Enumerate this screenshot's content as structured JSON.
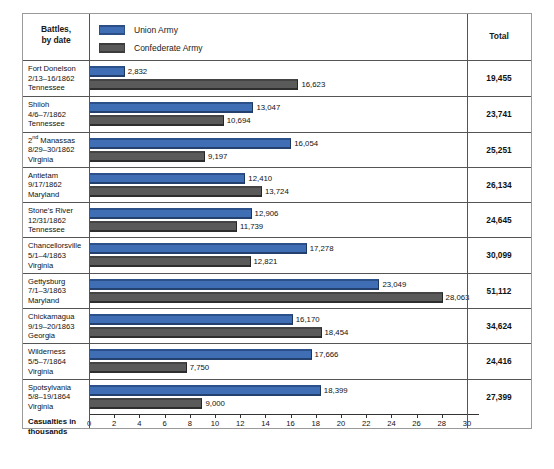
{
  "header": {
    "battles_header": "Battles,\nby date",
    "battles_header_line1": "Battles,",
    "battles_header_line2": "by date",
    "total_header": "Total"
  },
  "legend": {
    "items": [
      {
        "label": "Union Army",
        "color": "#3f6eb5",
        "key": "union"
      },
      {
        "label": "Confederate Army",
        "color": "#595959",
        "key": "confederate"
      }
    ]
  },
  "axis": {
    "title_line1": "Casualties in",
    "title_line2": "thousands",
    "ticks": [
      "0",
      "2",
      "4",
      "6",
      "8",
      "10",
      "12",
      "14",
      "16",
      "18",
      "20",
      "22",
      "24",
      "26",
      "28",
      "30"
    ],
    "min": 0,
    "max": 30
  },
  "chart_data": {
    "type": "bar",
    "orientation": "horizontal",
    "title": "",
    "xlabel": "Casualties in thousands",
    "ylabel": "Battles, by date",
    "xlim": [
      0,
      30
    ],
    "grid": false,
    "legend_position": "top-left",
    "categories": [
      "Fort Donelson 2/13-16/1862 Tennessee",
      "Shiloh 4/6-7/1862 Tennessee",
      "2nd Manassas 8/29-30/1862 Virginia",
      "Antietam 9/17/1862 Maryland",
      "Stone's River 12/31/1862 Tennessee",
      "Chancellorsville 5/1-4/1863 Virginia",
      "Gettysburg 7/1-3/1863 Maryland",
      "Chickamagua 9/19-20/1863 Georgia",
      "Wilderness 5/5-7/1864 Virginia",
      "Spotsylvania 5/8-19/1864 Virginia"
    ],
    "series": [
      {
        "name": "Union Army",
        "color": "#3f6eb5",
        "values": [
          2832,
          13047,
          16054,
          12410,
          12906,
          17278,
          23049,
          16170,
          17666,
          18399
        ]
      },
      {
        "name": "Confederate Army",
        "color": "#595959",
        "values": [
          16623,
          10694,
          9197,
          13724,
          11739,
          12821,
          28063,
          18454,
          7750,
          9000
        ]
      }
    ],
    "totals": [
      19455,
      23741,
      25251,
      26134,
      24645,
      30099,
      51112,
      34624,
      24416,
      27399
    ]
  },
  "rows": [
    {
      "name": "Fort Donelson",
      "date": "2/13–16/1862",
      "state": "Tennessee",
      "union": 2832,
      "union_label": "2,832",
      "confederate": 16623,
      "confederate_label": "16,623",
      "total": "19,455"
    },
    {
      "name": "Shiloh",
      "date": "4/6–7/1862",
      "state": "Tennessee",
      "union": 13047,
      "union_label": "13,047",
      "confederate": 10694,
      "confederate_label": "10,694",
      "total": "23,741"
    },
    {
      "name": "2nd Manassas",
      "name_num": "2",
      "name_sup": "nd",
      "name_rest": " Manassas",
      "date": "8/29–30/1862",
      "state": "Virginia",
      "union": 16054,
      "union_label": "16,054",
      "confederate": 9197,
      "confederate_label": "9,197",
      "total": "25,251"
    },
    {
      "name": "Antietam",
      "date": "9/17/1862",
      "state": "Maryland",
      "union": 12410,
      "union_label": "12,410",
      "confederate": 13724,
      "confederate_label": "13,724",
      "total": "26,134"
    },
    {
      "name": "Stone's River",
      "date": "12/31/1862",
      "state": "Tennessee",
      "union": 12906,
      "union_label": "12,906",
      "confederate": 11739,
      "confederate_label": "11,739",
      "total": "24,645"
    },
    {
      "name": "Chancellorsville",
      "date": "5/1–4/1863",
      "state": "Virginia",
      "union": 17278,
      "union_label": "17,278",
      "confederate": 12821,
      "confederate_label": "12,821",
      "total": "30,099"
    },
    {
      "name": "Gettysburg",
      "date": "7/1–3/1863",
      "state": "Maryland",
      "union": 23049,
      "union_label": "23,049",
      "confederate": 28063,
      "confederate_label": "28,063",
      "total": "51,112"
    },
    {
      "name": "Chickamagua",
      "date": "9/19–20/1863",
      "state": "Georgia",
      "union": 16170,
      "union_label": "16,170",
      "confederate": 18454,
      "confederate_label": "18,454",
      "total": "34,624"
    },
    {
      "name": "Wilderness",
      "date": "5/5–7/1864",
      "state": "Virginia",
      "union": 17666,
      "union_label": "17,666",
      "confederate": 7750,
      "confederate_label": "7,750",
      "total": "24,416"
    },
    {
      "name": "Spotsylvania",
      "date": "5/8–19/1864",
      "state": "Virginia",
      "union": 18399,
      "union_label": "18,399",
      "confederate": 9000,
      "confederate_label": "9,000",
      "total": "27,399"
    }
  ]
}
